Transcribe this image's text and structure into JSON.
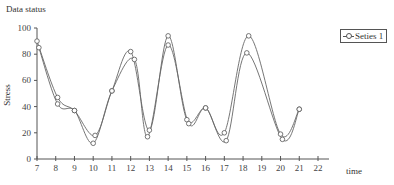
{
  "chart_data": {
    "type": "line",
    "title": "Data status",
    "xlabel": "time",
    "ylabel": "Stress",
    "xlim": [
      7,
      22
    ],
    "ylim": [
      0,
      100
    ],
    "x_ticks": [
      7,
      8,
      9,
      10,
      11,
      12,
      13,
      14,
      15,
      16,
      17,
      18,
      19,
      20,
      21,
      22
    ],
    "y_ticks": [
      0,
      20,
      40,
      60,
      80,
      100
    ],
    "grid": false,
    "legend_position": "right",
    "legend": [
      "Seties 1"
    ],
    "series": [
      {
        "name": "Seties 1",
        "x": [
          7,
          8.1,
          9,
          10.1,
          11,
          12,
          13,
          14,
          15,
          16,
          17,
          18.3,
          20,
          21
        ],
        "values": [
          90,
          47,
          37,
          18,
          52,
          82,
          22,
          94,
          30,
          39,
          20,
          94,
          19,
          38
        ]
      },
      {
        "name": "fit",
        "x": [
          7.1,
          8.1,
          9,
          10,
          11,
          12.2,
          12.9,
          14,
          15.1,
          16,
          17.1,
          18.2,
          20.1,
          21
        ],
        "values": [
          85,
          42,
          37,
          12,
          52,
          76,
          17,
          87,
          27,
          39,
          14,
          81,
          15,
          38
        ]
      }
    ]
  },
  "labels": {
    "title": "Data status",
    "xlabel": "time",
    "ylabel": "Stress",
    "legend_series": "Seties 1"
  }
}
